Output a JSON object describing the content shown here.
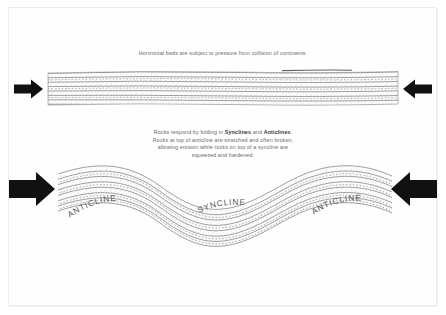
{
  "figure": {
    "background_color": "#ffffff",
    "ink_color": "#6b6b6b",
    "arrow_color": "#111111"
  },
  "captions": {
    "top": "Horizontal beds are subject to pressure from collision of continents.",
    "middle_line_1_pre": "Rocks respond by folding in ",
    "middle_line_1_bold_1": "Synclines",
    "middle_line_1_mid": " and ",
    "middle_line_1_bold_2": "Anticlines",
    "middle_line_1_post": ".",
    "middle_line_2": "Rocks at top of anticline are stretched and often broken,",
    "middle_line_3": "allowing erosion while rocks on top of a syncline are",
    "middle_line_4": "squeezed and hardened."
  },
  "panels": {
    "top_panel": {
      "name": "horizontal-beds",
      "description": "Flat-lying stippled sedimentary layers",
      "bed_count": 7
    },
    "bottom_panel": {
      "name": "folded-beds",
      "description": "Sinusoidally folded stippled sedimentary layers",
      "bed_count": 7
    }
  },
  "fold_labels": [
    {
      "text": "ANTICLINE",
      "position": "left"
    },
    {
      "text": "SYNCLINE",
      "position": "center"
    },
    {
      "text": "ANTICLINE",
      "position": "right"
    }
  ],
  "arrows": [
    {
      "name": "compression-arrow-top-left",
      "direction": "right",
      "size": "small"
    },
    {
      "name": "compression-arrow-top-right",
      "direction": "left",
      "size": "small"
    },
    {
      "name": "compression-arrow-bottom-left",
      "direction": "right",
      "size": "large"
    },
    {
      "name": "compression-arrow-bottom-right",
      "direction": "left",
      "size": "large"
    }
  ]
}
